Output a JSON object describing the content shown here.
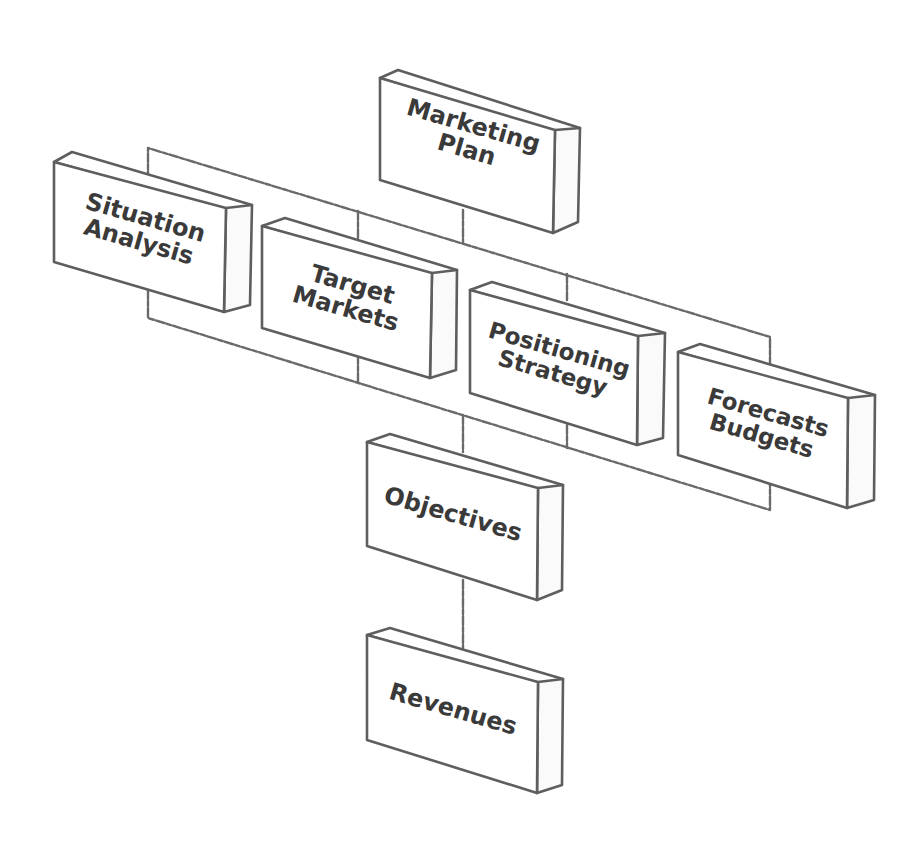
{
  "diagram": {
    "nodes": [
      {
        "id": "marketing-plan",
        "lines": [
          "Marketing",
          "Plan"
        ]
      },
      {
        "id": "situation-analysis",
        "lines": [
          "Situation",
          "Analysis"
        ]
      },
      {
        "id": "target-markets",
        "lines": [
          "Target",
          "Markets"
        ]
      },
      {
        "id": "positioning-strategy",
        "lines": [
          "Positioning",
          "Strategy"
        ]
      },
      {
        "id": "forecasts-budgets",
        "lines": [
          "Forecasts",
          "Budgets"
        ]
      },
      {
        "id": "objectives",
        "lines": [
          "Objectives"
        ]
      },
      {
        "id": "revenues",
        "lines": [
          "Revenues"
        ]
      }
    ],
    "edges": [
      {
        "from": "marketing-plan",
        "to": "situation-analysis"
      },
      {
        "from": "marketing-plan",
        "to": "target-markets"
      },
      {
        "from": "marketing-plan",
        "to": "positioning-strategy"
      },
      {
        "from": "marketing-plan",
        "to": "forecasts-budgets"
      },
      {
        "from": "situation-analysis",
        "to": "objectives"
      },
      {
        "from": "target-markets",
        "to": "objectives"
      },
      {
        "from": "positioning-strategy",
        "to": "objectives"
      },
      {
        "from": "forecasts-budgets",
        "to": "objectives"
      },
      {
        "from": "objectives",
        "to": "revenues"
      }
    ],
    "colors": {
      "stroke": "#5e5e5e",
      "text": "#3a3a3a",
      "background": "#ffffff"
    }
  }
}
